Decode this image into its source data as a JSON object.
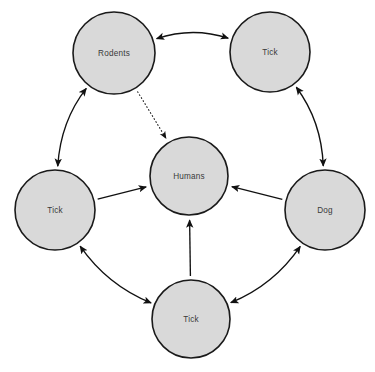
{
  "diagram": {
    "background_color": "#ffffff",
    "node_fill_color": "#d9d9d9",
    "node_stroke_color": "#1a1a1a",
    "edge_color": "#111111",
    "label_color": "#3a3a3a",
    "nodes": [
      {
        "id": "rodents",
        "label": "Rodents",
        "cx": 114,
        "cy": 53,
        "r": 41
      },
      {
        "id": "tick-top",
        "label": "Tick",
        "cx": 270,
        "cy": 52,
        "r": 40
      },
      {
        "id": "humans",
        "label": "Humans",
        "cx": 189,
        "cy": 176,
        "r": 39
      },
      {
        "id": "tick-left",
        "label": "Tick",
        "cx": 55,
        "cy": 210,
        "r": 40
      },
      {
        "id": "dog",
        "label": "Dog",
        "cx": 325,
        "cy": 210,
        "r": 40
      },
      {
        "id": "tick-bottom",
        "label": "Tick",
        "cx": 191,
        "cy": 319,
        "r": 39
      }
    ],
    "edges": [
      {
        "id": "rodents-tick-top",
        "from": "rodents",
        "to": "tick-top",
        "style": "curved",
        "arrows": "both",
        "dashed": false
      },
      {
        "id": "rodents-tick-left",
        "from": "rodents",
        "to": "tick-left",
        "style": "curved",
        "arrows": "both",
        "dashed": false
      },
      {
        "id": "tick-top-dog",
        "from": "tick-top",
        "to": "dog",
        "style": "curved",
        "arrows": "both",
        "dashed": false
      },
      {
        "id": "tick-left-tick-bottom",
        "from": "tick-left",
        "to": "tick-bottom",
        "style": "curved",
        "arrows": "both",
        "dashed": false
      },
      {
        "id": "tick-bottom-dog",
        "from": "tick-bottom",
        "to": "dog",
        "style": "curved",
        "arrows": "both",
        "dashed": false
      },
      {
        "id": "rodents-humans",
        "from": "rodents",
        "to": "humans",
        "style": "straight",
        "arrows": "end",
        "dashed": true
      },
      {
        "id": "tick-left-humans",
        "from": "tick-left",
        "to": "humans",
        "style": "straight",
        "arrows": "end",
        "dashed": false
      },
      {
        "id": "dog-humans",
        "from": "dog",
        "to": "humans",
        "style": "straight",
        "arrows": "end",
        "dashed": false
      },
      {
        "id": "tick-bottom-humans",
        "from": "tick-bottom",
        "to": "humans",
        "style": "straight",
        "arrows": "end",
        "dashed": false
      }
    ]
  }
}
